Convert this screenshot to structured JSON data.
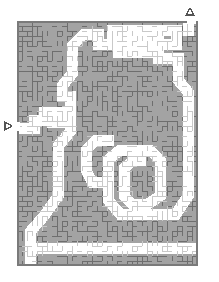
{
  "figure": {
    "type": "maze-puzzle",
    "width": 219,
    "height": 282,
    "background_color": "#ffffff",
    "title": "",
    "caption": ""
  },
  "maze": {
    "x": 17,
    "y": 21,
    "width": 181,
    "height": 245,
    "cols": 36,
    "rows": 49,
    "cell": 5,
    "fill_color": "#a3a3a3",
    "wall_color": "#6e6e6e",
    "path_fill_color": "#ffffff",
    "path_wall_color": "#c9c9c9",
    "border_color": "#7a7a7a",
    "border_width": 2,
    "seed": 20240517
  },
  "markers": {
    "entrance": {
      "label": "entrance-marker",
      "glyph": "▷",
      "direction": "right",
      "x": 9,
      "y": 126,
      "color": "#555555"
    },
    "exit": {
      "label": "exit-marker",
      "glyph": "△",
      "direction": "up",
      "x": 190,
      "y": 12,
      "color": "#555555"
    }
  },
  "solution_region": {
    "description": "white corridor traced from the left-edge entrance up and around to the top-right exit",
    "stroke_width": 11,
    "polyline": [
      [
        17,
        128
      ],
      [
        34,
        128
      ],
      [
        34,
        120
      ],
      [
        44,
        120
      ],
      [
        44,
        112
      ],
      [
        52,
        112
      ],
      [
        52,
        122
      ],
      [
        62,
        122
      ],
      [
        62,
        112
      ],
      [
        70,
        112
      ],
      [
        70,
        96
      ],
      [
        62,
        96
      ],
      [
        62,
        86
      ],
      [
        72,
        74
      ],
      [
        72,
        46
      ],
      [
        84,
        34
      ],
      [
        98,
        34
      ],
      [
        98,
        44
      ],
      [
        112,
        44
      ],
      [
        112,
        30
      ],
      [
        176,
        30
      ],
      [
        176,
        44
      ],
      [
        158,
        44
      ],
      [
        158,
        58
      ],
      [
        178,
        58
      ],
      [
        178,
        80
      ],
      [
        188,
        92
      ],
      [
        188,
        196
      ],
      [
        176,
        214
      ],
      [
        120,
        214
      ],
      [
        108,
        200
      ],
      [
        108,
        160
      ],
      [
        120,
        150
      ],
      [
        150,
        150
      ],
      [
        160,
        160
      ],
      [
        160,
        196
      ],
      [
        148,
        204
      ],
      [
        132,
        204
      ],
      [
        124,
        196
      ],
      [
        124,
        168
      ],
      [
        134,
        160
      ],
      [
        140,
        160
      ]
    ],
    "branches": [
      {
        "name": "left-lower-lobe",
        "polyline": [
          [
            70,
            112
          ],
          [
            70,
            132
          ],
          [
            58,
            146
          ],
          [
            58,
            196
          ],
          [
            44,
            216
          ],
          [
            30,
            232
          ],
          [
            30,
            262
          ]
        ]
      },
      {
        "name": "bottom-sweep",
        "polyline": [
          [
            30,
            248
          ],
          [
            100,
            248
          ],
          [
            170,
            248
          ],
          [
            196,
            248
          ]
        ]
      },
      {
        "name": "mid-basin",
        "polyline": [
          [
            108,
            182
          ],
          [
            92,
            182
          ],
          [
            86,
            170
          ],
          [
            86,
            150
          ],
          [
            96,
            140
          ],
          [
            108,
            140
          ]
        ]
      },
      {
        "name": "upper-comb",
        "polyline": [
          [
            118,
            36
          ],
          [
            118,
            52
          ],
          [
            126,
            52
          ],
          [
            126,
            36
          ],
          [
            134,
            36
          ],
          [
            134,
            52
          ],
          [
            142,
            52
          ],
          [
            142,
            36
          ],
          [
            150,
            36
          ],
          [
            150,
            52
          ],
          [
            158,
            52
          ],
          [
            158,
            36
          ]
        ]
      },
      {
        "name": "exit-stub",
        "polyline": [
          [
            188,
            30
          ],
          [
            188,
            21
          ]
        ]
      }
    ]
  }
}
